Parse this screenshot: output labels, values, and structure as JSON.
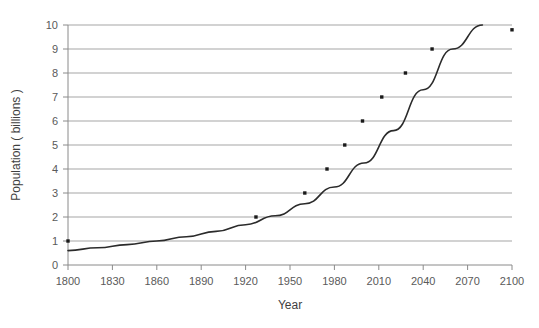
{
  "chart_data": {
    "type": "line",
    "title": "",
    "xlabel": "Year",
    "ylabel": "Population ( billions )",
    "xlim": [
      1800,
      2100
    ],
    "ylim": [
      0,
      10
    ],
    "grid": "horizontal",
    "legend": "none",
    "xticks": [
      "1800",
      "1830",
      "1860",
      "1890",
      "1920",
      "1950",
      "1980",
      "2010",
      "2040",
      "2070",
      "2100"
    ],
    "xtick_values": [
      1800,
      1830,
      1860,
      1890,
      1920,
      1950,
      1980,
      2010,
      2040,
      2070,
      2100
    ],
    "yticks": [
      "0",
      "1",
      "2",
      "3",
      "4",
      "5",
      "6",
      "7",
      "8",
      "9",
      "10"
    ],
    "ytick_values": [
      0,
      1,
      2,
      3,
      4,
      5,
      6,
      7,
      8,
      9,
      10
    ],
    "series": [
      {
        "name": "fitted-curve",
        "style": "line",
        "color": "#2b2b2b",
        "x": [
          1800,
          1820,
          1840,
          1860,
          1880,
          1900,
          1920,
          1940,
          1960,
          1980,
          2000,
          2020,
          2040,
          2060,
          2080
        ],
        "values": [
          0.6,
          0.72,
          0.85,
          1.0,
          1.18,
          1.4,
          1.68,
          2.05,
          2.55,
          3.25,
          4.25,
          5.6,
          7.3,
          9.0,
          10.0
        ]
      },
      {
        "name": "data-points",
        "style": "scatter",
        "color": "#1a1a1a",
        "x": [
          1800,
          1927,
          1960,
          1975,
          1987,
          1999,
          2012,
          2028,
          2046,
          2100
        ],
        "values": [
          1.0,
          2.0,
          3.0,
          4.0,
          5.0,
          6.0,
          7.0,
          8.0,
          9.0,
          9.8
        ]
      }
    ]
  },
  "axis": {
    "x_title": "Year",
    "y_title": "Population ( billions )"
  }
}
